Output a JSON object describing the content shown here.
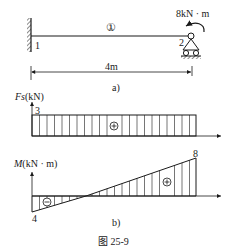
{
  "figure": {
    "caption": "图   25-9",
    "panel_a_label": "a)",
    "panel_b_label": "b)"
  },
  "beam": {
    "element_label": "①",
    "node_left": "1",
    "node_right": "2",
    "moment_label": "8kN · m",
    "length_label": "4m",
    "left_support": "fixed-wall",
    "right_support": "roller-pin"
  },
  "shear_diagram": {
    "axis_label_italic": "Fs",
    "axis_label_unit": "(kN)",
    "value_label": "3",
    "sign": "+"
  },
  "moment_diagram": {
    "axis_label_italic": "M",
    "axis_label_unit": "(kN · m)",
    "left_value_label": "4",
    "right_value_label": "8",
    "neg_sign": "−",
    "pos_sign": "+"
  },
  "colors": {
    "line": "#1a1a1a",
    "background": "#ffffff"
  }
}
